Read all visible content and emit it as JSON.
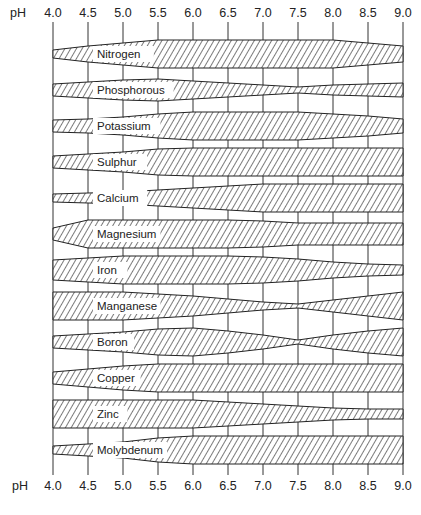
{
  "chart_data": {
    "type": "area",
    "title": "",
    "xlabel": "pH",
    "ylabel": "",
    "axis_label": "pH",
    "x": [
      4.0,
      4.5,
      5.0,
      5.5,
      6.0,
      6.5,
      7.0,
      7.5,
      8.0,
      8.5,
      9.0
    ],
    "x_tick_labels": [
      "4.0",
      "4.5",
      "5.0",
      "5.5",
      "6.0",
      "6.5",
      "7.0",
      "7.5",
      "8.0",
      "8.5",
      "9.0"
    ],
    "xlim": [
      4.0,
      9.0
    ],
    "grid": true,
    "legend": "none",
    "series": [
      {
        "name": "Nitrogen",
        "values": [
          4,
          8,
          11,
          14,
          14,
          14,
          14,
          14,
          14,
          11,
          8
        ]
      },
      {
        "name": "Phosphorous",
        "values": [
          6,
          8,
          10,
          11,
          9,
          7,
          5,
          3,
          5,
          6,
          7
        ]
      },
      {
        "name": "Potassium",
        "values": [
          6,
          7,
          9,
          12,
          14,
          14,
          14,
          14,
          12,
          10,
          7
        ]
      },
      {
        "name": "Sulphur",
        "values": [
          6,
          8,
          10,
          13,
          14,
          14,
          14,
          14,
          14,
          14,
          14
        ]
      },
      {
        "name": "Calcium",
        "values": [
          4,
          5,
          6,
          8,
          10,
          12,
          14,
          14,
          14,
          14,
          14
        ]
      },
      {
        "name": "Magnesium",
        "values": [
          6,
          14,
          14,
          14,
          14,
          14,
          13,
          11,
          11,
          11,
          11
        ]
      },
      {
        "name": "Iron",
        "values": [
          10,
          12,
          14,
          14,
          14,
          14,
          13,
          11,
          8,
          6,
          5
        ]
      },
      {
        "name": "Manganese",
        "values": [
          14,
          14,
          14,
          12,
          10,
          7,
          4,
          2,
          6,
          10,
          14
        ]
      },
      {
        "name": "Boron",
        "values": [
          6,
          8,
          10,
          13,
          14,
          11,
          7,
          2,
          7,
          11,
          14
        ]
      },
      {
        "name": "Copper",
        "values": [
          6,
          9,
          12,
          14,
          14,
          14,
          14,
          14,
          14,
          14,
          14
        ]
      },
      {
        "name": "Zinc",
        "values": [
          14,
          14,
          14,
          14,
          14,
          12,
          10,
          8,
          6,
          5,
          5
        ]
      },
      {
        "name": "Molybdenum",
        "values": [
          4,
          6,
          8,
          12,
          14,
          14,
          14,
          14,
          14,
          14,
          14
        ]
      }
    ]
  },
  "axis": {
    "top_label": "pH",
    "bottom_label": "pH"
  }
}
